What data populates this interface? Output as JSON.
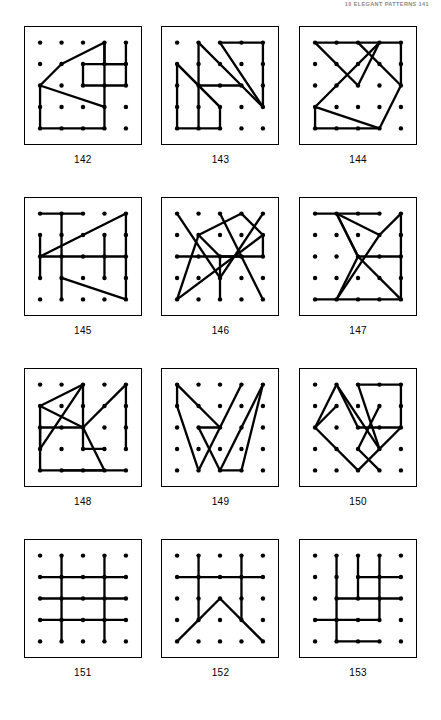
{
  "running_head": "10 ELEGANT PATTERNS 141",
  "page": {
    "width": 441,
    "height": 720,
    "background": "#ffffff",
    "ink": "#000000"
  },
  "grid": {
    "columns": 3,
    "rows": 4,
    "dot_lattice": {
      "cols": 5,
      "rows": 5
    }
  },
  "figures": [
    {
      "caption": "142",
      "dots": 25,
      "segments": [
        [
          [
            3,
            0
          ],
          [
            1,
            1
          ]
        ],
        [
          [
            1,
            1
          ],
          [
            0,
            2
          ]
        ],
        [
          [
            0,
            2
          ],
          [
            3,
            3
          ]
        ],
        [
          [
            3,
            3
          ],
          [
            3,
            0
          ]
        ],
        [
          [
            3,
            0
          ],
          [
            3,
            1
          ]
        ],
        [
          [
            3,
            1
          ],
          [
            4,
            1
          ]
        ],
        [
          [
            4,
            1
          ],
          [
            4,
            0
          ]
        ],
        [
          [
            2,
            1
          ],
          [
            4,
            1
          ]
        ],
        [
          [
            2,
            1
          ],
          [
            2,
            2
          ]
        ],
        [
          [
            2,
            2
          ],
          [
            4,
            2
          ]
        ],
        [
          [
            4,
            2
          ],
          [
            4,
            1
          ]
        ],
        [
          [
            0,
            2
          ],
          [
            0,
            4
          ]
        ],
        [
          [
            0,
            4
          ],
          [
            3,
            4
          ]
        ],
        [
          [
            3,
            4
          ],
          [
            3,
            3
          ]
        ]
      ]
    },
    {
      "caption": "143",
      "dots": 25,
      "segments": [
        [
          [
            1,
            0
          ],
          [
            3,
            2
          ]
        ],
        [
          [
            3,
            2
          ],
          [
            4,
            3
          ]
        ],
        [
          [
            4,
            3
          ],
          [
            2,
            0
          ]
        ],
        [
          [
            2,
            0
          ],
          [
            4,
            0
          ]
        ],
        [
          [
            4,
            0
          ],
          [
            4,
            3
          ]
        ],
        [
          [
            0,
            1
          ],
          [
            1,
            2
          ]
        ],
        [
          [
            1,
            2
          ],
          [
            2,
            3
          ]
        ],
        [
          [
            2,
            3
          ],
          [
            0,
            1
          ]
        ],
        [
          [
            0,
            1
          ],
          [
            0,
            4
          ]
        ],
        [
          [
            0,
            4
          ],
          [
            2,
            4
          ]
        ],
        [
          [
            2,
            4
          ],
          [
            2,
            3
          ]
        ],
        [
          [
            1,
            0
          ],
          [
            1,
            4
          ]
        ],
        [
          [
            1,
            2
          ],
          [
            3,
            2
          ]
        ]
      ]
    },
    {
      "caption": "144",
      "dots": 25,
      "segments": [
        [
          [
            0,
            0
          ],
          [
            4,
            0
          ]
        ],
        [
          [
            0,
            0
          ],
          [
            2,
            2
          ]
        ],
        [
          [
            2,
            2
          ],
          [
            3,
            0
          ]
        ],
        [
          [
            3,
            0
          ],
          [
            1,
            2
          ]
        ],
        [
          [
            1,
            2
          ],
          [
            0,
            3
          ]
        ],
        [
          [
            0,
            3
          ],
          [
            0,
            4
          ]
        ],
        [
          [
            0,
            4
          ],
          [
            3,
            4
          ]
        ],
        [
          [
            3,
            4
          ],
          [
            4,
            2
          ]
        ],
        [
          [
            4,
            2
          ],
          [
            2,
            0
          ]
        ],
        [
          [
            0,
            3
          ],
          [
            3,
            4
          ]
        ],
        [
          [
            4,
            0
          ],
          [
            4,
            2
          ]
        ]
      ]
    },
    {
      "caption": "145",
      "dots": 25,
      "segments": [
        [
          [
            0,
            0
          ],
          [
            2,
            0
          ]
        ],
        [
          [
            1,
            0
          ],
          [
            1,
            4
          ]
        ],
        [
          [
            0,
            1
          ],
          [
            0,
            3
          ]
        ],
        [
          [
            0,
            2
          ],
          [
            4,
            0
          ]
        ],
        [
          [
            4,
            0
          ],
          [
            4,
            3
          ]
        ],
        [
          [
            0,
            2
          ],
          [
            4,
            2
          ]
        ],
        [
          [
            3,
            1
          ],
          [
            3,
            3
          ]
        ],
        [
          [
            1,
            3
          ],
          [
            4,
            4
          ]
        ],
        [
          [
            4,
            4
          ],
          [
            4,
            3
          ]
        ]
      ]
    },
    {
      "caption": "146",
      "dots": 25,
      "segments": [
        [
          [
            0,
            0
          ],
          [
            2,
            3
          ]
        ],
        [
          [
            2,
            3
          ],
          [
            4,
            0
          ]
        ],
        [
          [
            1,
            1
          ],
          [
            3,
            0
          ]
        ],
        [
          [
            3,
            0
          ],
          [
            4,
            1
          ]
        ],
        [
          [
            4,
            1
          ],
          [
            4,
            2
          ]
        ],
        [
          [
            4,
            2
          ],
          [
            2,
            2
          ]
        ],
        [
          [
            2,
            2
          ],
          [
            1,
            1
          ]
        ],
        [
          [
            1,
            1
          ],
          [
            0,
            4
          ]
        ],
        [
          [
            0,
            4
          ],
          [
            4,
            1
          ]
        ],
        [
          [
            0,
            2
          ],
          [
            3,
            2
          ]
        ],
        [
          [
            2,
            2
          ],
          [
            2,
            4
          ]
        ],
        [
          [
            2,
            0
          ],
          [
            4,
            4
          ]
        ]
      ]
    },
    {
      "caption": "147",
      "dots": 25,
      "segments": [
        [
          [
            0,
            0
          ],
          [
            3,
            0
          ]
        ],
        [
          [
            1,
            0
          ],
          [
            3,
            1
          ]
        ],
        [
          [
            3,
            1
          ],
          [
            4,
            0
          ]
        ],
        [
          [
            4,
            0
          ],
          [
            4,
            4
          ]
        ],
        [
          [
            1,
            0
          ],
          [
            2,
            2
          ]
        ],
        [
          [
            2,
            2
          ],
          [
            1,
            0
          ]
        ],
        [
          [
            3,
            1
          ],
          [
            1,
            4
          ]
        ],
        [
          [
            1,
            4
          ],
          [
            2,
            2
          ]
        ],
        [
          [
            2,
            2
          ],
          [
            4,
            4
          ]
        ],
        [
          [
            1,
            4
          ],
          [
            4,
            4
          ]
        ],
        [
          [
            0,
            4
          ],
          [
            1,
            4
          ]
        ],
        [
          [
            4,
            2
          ],
          [
            2,
            2
          ]
        ]
      ]
    },
    {
      "caption": "148",
      "dots": 25,
      "segments": [
        [
          [
            2,
            0
          ],
          [
            0,
            1
          ]
        ],
        [
          [
            0,
            1
          ],
          [
            2,
            2
          ]
        ],
        [
          [
            2,
            2
          ],
          [
            2,
            0
          ]
        ],
        [
          [
            2,
            0
          ],
          [
            0,
            3
          ]
        ],
        [
          [
            0,
            3
          ],
          [
            0,
            1
          ]
        ],
        [
          [
            0,
            2
          ],
          [
            0,
            4
          ]
        ],
        [
          [
            0,
            4
          ],
          [
            3,
            4
          ]
        ],
        [
          [
            3,
            4
          ],
          [
            2,
            2
          ]
        ],
        [
          [
            2,
            2
          ],
          [
            2,
            3
          ]
        ],
        [
          [
            2,
            3
          ],
          [
            3,
            3
          ]
        ],
        [
          [
            2,
            2
          ],
          [
            4,
            0
          ]
        ],
        [
          [
            4,
            0
          ],
          [
            4,
            3
          ]
        ],
        [
          [
            1,
            4
          ],
          [
            4,
            4
          ]
        ],
        [
          [
            0,
            2
          ],
          [
            2,
            2
          ]
        ]
      ]
    },
    {
      "caption": "149",
      "dots": 25,
      "segments": [
        [
          [
            0,
            0
          ],
          [
            2,
            2
          ]
        ],
        [
          [
            2,
            2
          ],
          [
            3,
            0
          ]
        ],
        [
          [
            0,
            0
          ],
          [
            0,
            1
          ]
        ],
        [
          [
            0,
            1
          ],
          [
            1,
            4
          ]
        ],
        [
          [
            1,
            4
          ],
          [
            2,
            2
          ]
        ],
        [
          [
            1,
            2
          ],
          [
            2,
            4
          ]
        ],
        [
          [
            2,
            4
          ],
          [
            4,
            0
          ]
        ],
        [
          [
            4,
            0
          ],
          [
            3,
            4
          ]
        ],
        [
          [
            3,
            4
          ],
          [
            2,
            4
          ]
        ],
        [
          [
            1,
            2
          ],
          [
            2,
            2
          ]
        ]
      ]
    },
    {
      "caption": "150",
      "dots": 25,
      "segments": [
        [
          [
            2,
            0
          ],
          [
            4,
            0
          ]
        ],
        [
          [
            4,
            0
          ],
          [
            4,
            2
          ]
        ],
        [
          [
            4,
            2
          ],
          [
            2,
            2
          ]
        ],
        [
          [
            2,
            2
          ],
          [
            1,
            0
          ]
        ],
        [
          [
            1,
            0
          ],
          [
            0,
            2
          ]
        ],
        [
          [
            0,
            2
          ],
          [
            2,
            4
          ]
        ],
        [
          [
            2,
            4
          ],
          [
            4,
            2
          ]
        ],
        [
          [
            0,
            2
          ],
          [
            1,
            1
          ]
        ],
        [
          [
            3,
            1
          ],
          [
            2,
            3
          ]
        ],
        [
          [
            2,
            3
          ],
          [
            3,
            4
          ]
        ],
        [
          [
            2,
            0
          ],
          [
            3,
            3
          ]
        ],
        [
          [
            1,
            0
          ],
          [
            3,
            3
          ]
        ]
      ]
    },
    {
      "caption": "151",
      "dots": 25,
      "segments": [
        [
          [
            1,
            0
          ],
          [
            1,
            4
          ]
        ],
        [
          [
            3,
            0
          ],
          [
            3,
            4
          ]
        ],
        [
          [
            0,
            1
          ],
          [
            4,
            1
          ]
        ],
        [
          [
            0,
            2
          ],
          [
            4,
            2
          ]
        ],
        [
          [
            0,
            3
          ],
          [
            4,
            3
          ]
        ]
      ]
    },
    {
      "caption": "152",
      "dots": 25,
      "segments": [
        [
          [
            1,
            0
          ],
          [
            1,
            3
          ]
        ],
        [
          [
            3,
            0
          ],
          [
            3,
            3
          ]
        ],
        [
          [
            0,
            1
          ],
          [
            4,
            1
          ]
        ],
        [
          [
            0,
            4
          ],
          [
            2,
            2
          ]
        ],
        [
          [
            2,
            2
          ],
          [
            4,
            4
          ]
        ]
      ]
    },
    {
      "caption": "153",
      "dots": 25,
      "segments": [
        [
          [
            1,
            0
          ],
          [
            1,
            4
          ]
        ],
        [
          [
            2,
            0
          ],
          [
            2,
            2
          ]
        ],
        [
          [
            3,
            0
          ],
          [
            3,
            3
          ]
        ],
        [
          [
            2,
            1
          ],
          [
            4,
            1
          ]
        ],
        [
          [
            1,
            2
          ],
          [
            4,
            2
          ]
        ],
        [
          [
            0,
            3
          ],
          [
            3,
            3
          ]
        ],
        [
          [
            1,
            4
          ],
          [
            3,
            4
          ]
        ]
      ]
    }
  ]
}
